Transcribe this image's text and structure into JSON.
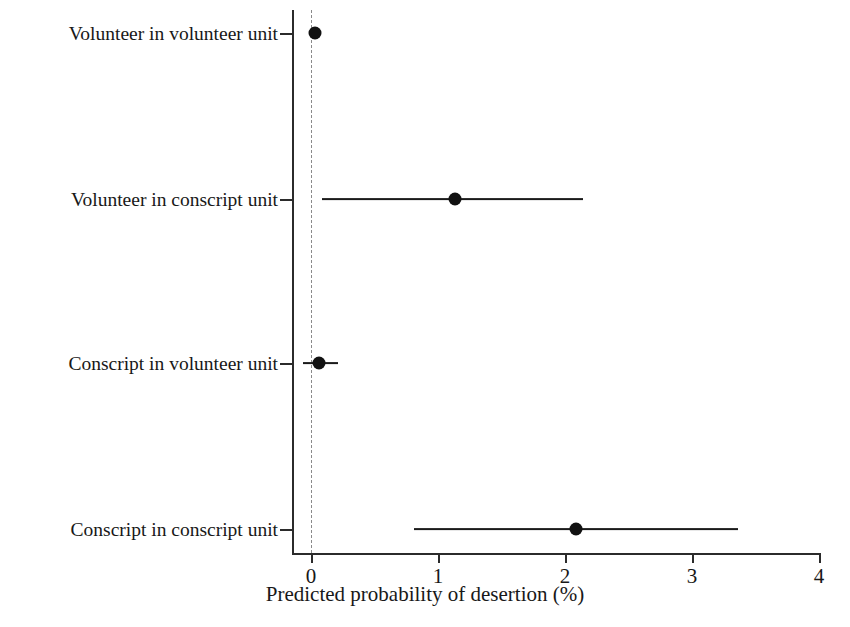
{
  "chart_data": {
    "type": "scatter",
    "title": "",
    "subtitle": "",
    "xlabel": "Predicted probability of desertion (%)",
    "ylabel": "",
    "xlim": [
      0,
      4
    ],
    "ylim_categories": 4,
    "grid": false,
    "legend": null,
    "orientation": "horizontal",
    "style": "coefficient-plot-with-confidence-intervals",
    "reference_line": {
      "x": 0,
      "style": "dashed",
      "color": "#8a8a8a"
    },
    "xticks": [
      "0",
      "1",
      "2",
      "3",
      "4"
    ],
    "xtick_values": [
      0,
      1,
      2,
      3,
      4
    ],
    "categories": [
      "Volunteer in volunteer unit",
      "Volunteer in conscript unit",
      "Conscript in volunteer unit",
      "Conscript in conscript unit"
    ],
    "points": [
      {
        "category": "Volunteer in volunteer unit",
        "estimate": 0.03,
        "ci_low": 0.0,
        "ci_high": 0.06
      },
      {
        "category": "Volunteer in conscript unit",
        "estimate": 1.13,
        "ci_low": 0.09,
        "ci_high": 2.14
      },
      {
        "category": "Conscript in volunteer unit",
        "estimate": 0.06,
        "ci_low": -0.06,
        "ci_high": 0.21
      },
      {
        "category": "Conscript in conscript unit",
        "estimate": 2.09,
        "ci_low": 0.81,
        "ci_high": 3.36
      }
    ],
    "colors": {
      "marker": "#111111",
      "interval": "#1a1a1a",
      "axis": "#2b2b2b",
      "reference": "#8a8a8a",
      "background": "#ffffff"
    }
  }
}
